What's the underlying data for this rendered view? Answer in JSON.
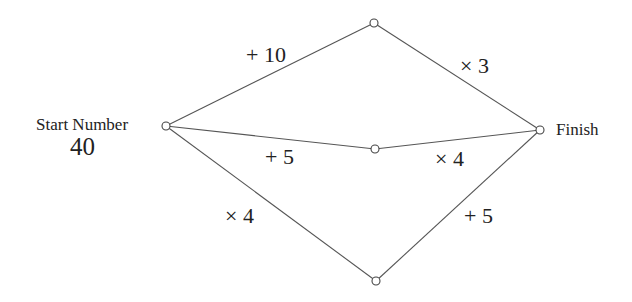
{
  "diagram": {
    "start": {
      "label": "Start Number",
      "value": "40"
    },
    "finish": {
      "label": "Finish"
    },
    "nodes": [
      {
        "id": "start",
        "x": 166,
        "y": 126
      },
      {
        "id": "top",
        "x": 374,
        "y": 23
      },
      {
        "id": "middle",
        "x": 375,
        "y": 149
      },
      {
        "id": "bottom",
        "x": 376,
        "y": 281
      },
      {
        "id": "finish",
        "x": 540,
        "y": 130
      }
    ],
    "edges": [
      {
        "from": "start",
        "to": "top",
        "label": "+ 10"
      },
      {
        "from": "top",
        "to": "finish",
        "label": "× 3"
      },
      {
        "from": "start",
        "to": "middle",
        "label": "+ 5"
      },
      {
        "from": "middle",
        "to": "finish",
        "label": "× 4"
      },
      {
        "from": "start",
        "to": "bottom",
        "label": "× 4"
      },
      {
        "from": "bottom",
        "to": "finish",
        "label": "+ 5"
      }
    ],
    "colors": {
      "line": "#555555",
      "text": "#222222",
      "background": "#ffffff"
    }
  }
}
